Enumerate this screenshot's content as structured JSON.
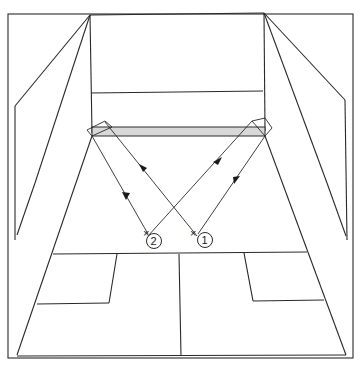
{
  "diagram": {
    "type": "squash-court-perspective",
    "colors": {
      "line": "#2a2a2a",
      "tin_fill": "#d8d8d8",
      "background": "#ffffff"
    },
    "players": [
      {
        "id": "player-1",
        "label": "1",
        "x": 202,
        "y": 240
      },
      {
        "id": "player-2",
        "label": "2",
        "x": 152,
        "y": 241
      }
    ],
    "shots": [
      {
        "from_player": "1",
        "to": "front-left-corner",
        "direction": "toward-front-wall"
      },
      {
        "from": "front-left-corner",
        "to_player": "2",
        "direction": "toward-player"
      },
      {
        "from_player": "2",
        "to": "front-right-corner",
        "direction": "toward-front-wall"
      },
      {
        "from": "front-right-corner",
        "to_player": "1",
        "direction": "toward-player"
      }
    ]
  }
}
